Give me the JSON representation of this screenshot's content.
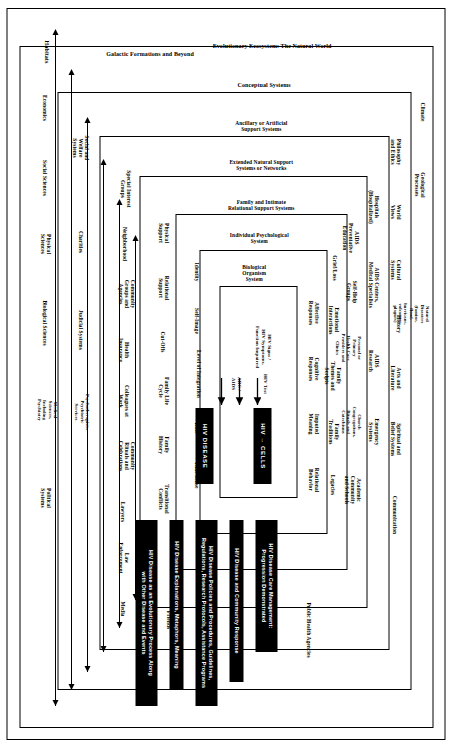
{
  "figure": {
    "axis_left_label": "Habitats",
    "axis_top_label": "Galactic Formations and Beyond",
    "axis_outer_label": "Evolutionary Ecosystem: The Natural World"
  },
  "rings": [
    {
      "id": "natural-world",
      "label": "Evolutionary Ecosystem:  The Natural World"
    },
    {
      "id": "conceptual",
      "label": "Conceptual Systems"
    },
    {
      "id": "artificial-support",
      "label": "Ancillary or Artificial\nSupport Systems"
    },
    {
      "id": "extended-natural",
      "label": "Extended Natural Support\nSystems or Networks"
    },
    {
      "id": "family-intimate",
      "label": "Family and Intimate\nRelational Support Systems"
    },
    {
      "id": "individual-psych",
      "label": "Individual Psychological\nSystem"
    },
    {
      "id": "biological",
      "label": "Biological\nOrganism\nSystem"
    }
  ],
  "ring_items": {
    "natural_world_top": [
      "Climate",
      "Geological\nProcesses",
      "Natural\nDisasters\n(famine,\nflood,\nhurricane,\nvolcanoes,\nplagues)"
    ],
    "natural_world_bottom": [
      "Economics",
      "Social Sciences",
      "Physical\nSciences",
      "Biological Sciences",
      "Medical\nSciences,\nIncluding\nPsychiatry",
      "Political\nSystems"
    ],
    "conceptual_top": [
      "Philosophy\nand Ethics",
      "World\nViews",
      "Cultural\nSystems",
      "History",
      "Arts and\nLiterature",
      "Spiritual and\nBelief Systems",
      "Communication"
    ],
    "conceptual_bottom": [
      "Social and\nWelfare\nSystems",
      "Charities",
      "Judicial Systems",
      "Psychotherapists,\nPsychiatric\nServices"
    ],
    "artificial_top": [
      "Hospitals\n(Hospitalized)",
      "AIDS Centers,\nMedical Specialists",
      "AIDS\nResearch",
      "Emergency\nSystems"
    ],
    "artificial_bottom": [
      "Special Interest\nGroups",
      "Neighborhood",
      "Community\nGroups and\nAgencies",
      "Health\nInsurance",
      "Colleagues at\nWork",
      "Community\nRituals and\nCelebrations",
      "Lawyers",
      "Law\nEnforcement",
      "Media"
    ],
    "extended_top": [
      "AIDS\nPreventative\nEducation",
      "Self-Help\nGroups",
      "Personal or\nPrimary\nHealth Care\nProviders and\nClinics",
      "Church\nCongregations,\nRituals and\nCatechisms",
      "Academic\nCommunity\nand Schools"
    ],
    "extended_bottom": [
      "Physical\nSupport",
      "Relational\nSupport",
      "Cut-Offs",
      "Family Life\nCycle",
      "Family\nHistory",
      "Transitional\nConflicts"
    ],
    "family_top": [
      "Grief/Loss",
      "Emotional\nInteractions",
      "Family\nThemes and\nScripts",
      "Family\nTraditions",
      "Legacies"
    ],
    "family_bottom": [
      "Identity",
      "Self-Image",
      "Level of Integration",
      "Role",
      "Time Sense"
    ],
    "individual_top": [
      "Affective\nResponses",
      "Cognitive\nResponses",
      "Imputed\nMeaning",
      "Relational\nBehavior"
    ]
  },
  "core": {
    "hiv_cells": "HIV → CELLS",
    "hiv_disease": "HIV DISEASE",
    "arrow_labels": [
      "HIV Test",
      "ARC /\nAIDS"
    ],
    "signs_label": "HIV Signs /\nHIV Symptoms,\nFunction Impaired"
  },
  "bars": [
    {
      "id": "care-management",
      "text": "HIV Disease Care Management:\nProgression Demonstrated"
    },
    {
      "id": "community-response",
      "text": "HIV Disease and Community Response"
    },
    {
      "id": "policies",
      "text": "HIV Disease Policies and Procedures, Guidelines,\nRegulations, Research Protocols, Assistance Programs"
    },
    {
      "id": "explanations",
      "text": "HIV Disease Explanations, Metaphors, Meaning"
    },
    {
      "id": "evolutionary",
      "text": "HIV Disease as an Evolutionary Process Along\nwith Other Disease and Events"
    }
  ],
  "edge_labels": {
    "friends": "Friends",
    "public_health": "Public Health Agencies"
  },
  "colors": {
    "ink": "#000000",
    "paper": "#ffffff"
  }
}
